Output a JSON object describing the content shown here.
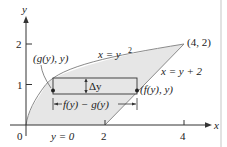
{
  "figure": {
    "axes": {
      "x_label": "x",
      "y_label": "y",
      "x_ticks": [
        "0",
        "2",
        "4"
      ],
      "y_ticks": [
        "1",
        "2"
      ]
    },
    "curves": {
      "parabola_label": "x = y",
      "parabola_exp": "2",
      "line_label": "x = y + 2"
    },
    "points": {
      "vertex": "(4, 2)",
      "left_point": "(g(y), y)",
      "right_point": "(f(y), y)"
    },
    "annotations": {
      "delta_y": "Δy",
      "width": "f(y) − g(y)",
      "bottom": "y = 0"
    },
    "colors": {
      "region_fill": "#e6e6e6",
      "curve": "#8a8a8a",
      "axis": "#333333",
      "frame": "#cfcfcf"
    }
  }
}
